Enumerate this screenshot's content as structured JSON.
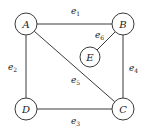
{
  "diagram": {
    "type": "graph",
    "nodes": [
      {
        "id": "A",
        "label": "A",
        "cx": 26,
        "cy": 24,
        "r": 11
      },
      {
        "id": "B",
        "label": "B",
        "cx": 123,
        "cy": 24,
        "r": 11
      },
      {
        "id": "E",
        "label": "E",
        "cx": 90,
        "cy": 57,
        "r": 10
      },
      {
        "id": "D",
        "label": "D",
        "cx": 26,
        "cy": 109,
        "r": 11
      },
      {
        "id": "C",
        "label": "C",
        "cx": 123,
        "cy": 109,
        "r": 11
      }
    ],
    "edges": [
      {
        "id": "e1",
        "base": "e",
        "sub": "1",
        "from": "A",
        "to": "B",
        "lx": 71,
        "ly": 14
      },
      {
        "id": "e2",
        "base": "e",
        "sub": "2",
        "from": "A",
        "to": "D",
        "lx": 8,
        "ly": 70
      },
      {
        "id": "e3",
        "base": "e",
        "sub": "3",
        "from": "D",
        "to": "C",
        "lx": 71,
        "ly": 124
      },
      {
        "id": "e4",
        "base": "e",
        "sub": "4",
        "from": "B",
        "to": "C",
        "lx": 129,
        "ly": 71
      },
      {
        "id": "e5",
        "base": "e",
        "sub": "5",
        "from": "A",
        "to": "C",
        "lx": 71,
        "ly": 83
      },
      {
        "id": "e6",
        "base": "e",
        "sub": "6",
        "from": "B",
        "to": "E",
        "lx": 95,
        "ly": 38
      }
    ]
  }
}
